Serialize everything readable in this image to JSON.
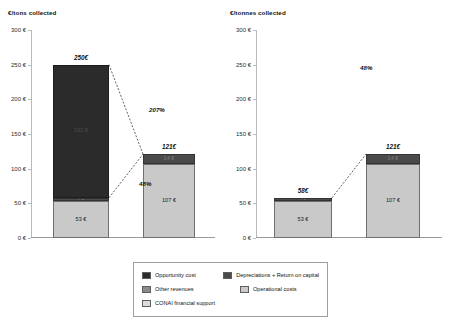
{
  "charts": [
    {
      "title": "€/tons collected",
      "yaxis": {
        "labels": [
          "300 €",
          "250 €",
          "200 €",
          "150 €",
          "100 €",
          "50 €",
          "0 €"
        ],
        "min": 0,
        "max": 300
      },
      "bars": [
        {
          "total_label": "250€",
          "segments": [
            {
              "key": "opportunity_cost",
              "label": "192 €",
              "value": 192,
              "tone": "dark"
            },
            {
              "key": "other_revenues",
              "label": "5 €",
              "value": 5,
              "tone": "mid"
            },
            {
              "key": "conai_financial_support",
              "label": "53 €",
              "value": 53,
              "tone": "light"
            }
          ]
        },
        {
          "total_label": "121€",
          "segments": [
            {
              "key": "depreciations_return_on_capital",
              "label": "14 €",
              "value": 14,
              "tone": "mid"
            },
            {
              "key": "operational_costs",
              "label": "107 €",
              "value": 107,
              "tone": "light"
            }
          ]
        }
      ],
      "annotations": [
        {
          "text": "207%",
          "x": 118,
          "y": 76
        },
        {
          "text": "48%",
          "x": 108,
          "y": 150
        }
      ]
    },
    {
      "title": "€/tonnes collected",
      "yaxis": {
        "labels": [
          "300 €",
          "250 €",
          "200 €",
          "150 €",
          "100 €",
          "50 €",
          "0 €"
        ],
        "min": 0,
        "max": 300
      },
      "bars": [
        {
          "total_label": "58€",
          "segments": [
            {
              "key": "other_revenues",
              "label": "5 €",
              "value": 5,
              "tone": "mid"
            },
            {
              "key": "conai_financial_support",
              "label": "53 €",
              "value": 53,
              "tone": "light"
            }
          ]
        },
        {
          "total_label": "121€",
          "segments": [
            {
              "key": "depreciations_return_on_capital",
              "label": "14 €",
              "value": 14,
              "tone": "mid"
            },
            {
              "key": "operational_costs",
              "label": "107 €",
              "value": 107,
              "tone": "light"
            }
          ]
        }
      ],
      "annotations": [
        {
          "text": "48%",
          "x": 104,
          "y": 34
        }
      ]
    }
  ],
  "legend": {
    "rows": [
      [
        {
          "label": "Opportunity cost",
          "color": "#2b2b2b"
        },
        {
          "label": "Depreciations + Return on capital",
          "color": "#4a4a4a"
        }
      ],
      [
        {
          "label": "Other revenues",
          "color": "#8a8a8a"
        },
        {
          "label": "Operational costs",
          "color": "#c9c9c9"
        }
      ],
      [
        {
          "label": "CONAI financial support",
          "color": "#dcdcdc"
        }
      ]
    ]
  },
  "chart_data": {
    "type": "bar",
    "subtype": "stacked-waterfall-comparison",
    "title": "",
    "panels": [
      {
        "title": "€/tons collected",
        "ylabel": "€/tons collected",
        "xlabel": "",
        "ylim": [
          0,
          300
        ],
        "ytick_labels": [
          "0 €",
          "50 €",
          "100 €",
          "150 €",
          "200 €",
          "250 €",
          "300 €"
        ],
        "ytick_values": [
          0,
          50,
          100,
          150,
          200,
          250,
          300
        ],
        "grid": false,
        "categories": [
          "Revenues side",
          "Costs side"
        ],
        "series": [
          {
            "name": "Opportunity cost",
            "values": [
              192,
              0
            ]
          },
          {
            "name": "Other revenues",
            "values": [
              5,
              0
            ]
          },
          {
            "name": "CONAI financial support",
            "values": [
              53,
              0
            ]
          },
          {
            "name": "Depreciations + Return on capital",
            "values": [
              0,
              14
            ]
          },
          {
            "name": "Operational costs",
            "values": [
              0,
              107
            ]
          }
        ],
        "bar_totals": [
          250,
          121
        ],
        "bar_total_labels": [
          "250€",
          "121€"
        ],
        "annotations": [
          "207%",
          "48%"
        ]
      },
      {
        "title": "€/tonnes collected",
        "ylabel": "€/tonnes collected",
        "xlabel": "",
        "ylim": [
          0,
          300
        ],
        "ytick_labels": [
          "0 €",
          "50 €",
          "100 €",
          "150 €",
          "200 €",
          "250 €",
          "300 €"
        ],
        "ytick_values": [
          0,
          50,
          100,
          150,
          200,
          250,
          300
        ],
        "grid": false,
        "categories": [
          "Revenues side",
          "Costs side"
        ],
        "series": [
          {
            "name": "Opportunity cost",
            "values": [
              0,
              0
            ]
          },
          {
            "name": "Other revenues",
            "values": [
              5,
              0
            ]
          },
          {
            "name": "CONAI financial support",
            "values": [
              53,
              0
            ]
          },
          {
            "name": "Depreciations + Return on capital",
            "values": [
              0,
              14
            ]
          },
          {
            "name": "Operational costs",
            "values": [
              0,
              107
            ]
          }
        ],
        "bar_totals": [
          58,
          121
        ],
        "bar_total_labels": [
          "58€",
          "121€"
        ],
        "annotations": [
          "48%"
        ]
      }
    ],
    "legend": {
      "position": "bottom",
      "entries": [
        "Opportunity cost",
        "Depreciations + Return on capital",
        "Other revenues",
        "Operational costs",
        "CONAI financial support"
      ]
    }
  }
}
